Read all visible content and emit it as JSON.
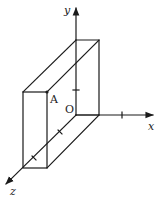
{
  "figure": {
    "type": "3d-coordinate-diagram",
    "axes": {
      "x": {
        "label": "x"
      },
      "y": {
        "label": "y"
      },
      "z": {
        "label": "z"
      }
    },
    "points": {
      "origin": {
        "label": "O"
      },
      "A": {
        "label": "A"
      }
    },
    "colors": {
      "line": "#1a1a1a",
      "background": "#ffffff"
    }
  }
}
